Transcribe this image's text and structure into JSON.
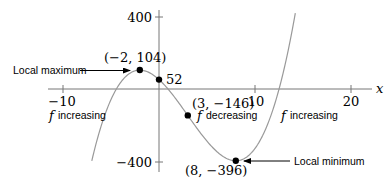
{
  "chart_data": {
    "type": "line",
    "title": "",
    "function": "f(x) = x^3 - 9x^2 - 48x + 52",
    "xlabel": "x",
    "ylabel": "",
    "xlim": [
      -10,
      20
    ],
    "ylim": [
      -400,
      400
    ],
    "x_ticks": [
      -10,
      10,
      20
    ],
    "x_tick_labels": [
      "−10",
      "10",
      "20"
    ],
    "y_ticks": [
      400,
      -400
    ],
    "y_tick_labels": [
      "400",
      "−400"
    ],
    "grid": false,
    "series": [
      {
        "name": "f",
        "domain": [
          -7,
          14.2
        ],
        "color": "#999999"
      }
    ],
    "points": [
      {
        "x": -2,
        "y": 104,
        "label": "(−2, 104)"
      },
      {
        "x": 0,
        "y": 52,
        "label": "52"
      },
      {
        "x": 3,
        "y": -146,
        "label": "(3, −146)"
      },
      {
        "x": 8,
        "y": -396,
        "label": "(8, −396)"
      }
    ],
    "annotations": [
      {
        "text": "Local maximum",
        "target": [
          -2,
          104
        ]
      },
      {
        "text": "Local minimum",
        "target": [
          8,
          -396
        ]
      },
      {
        "text": "f increasing",
        "region": "left"
      },
      {
        "text": "f decreasing",
        "region": "middle"
      },
      {
        "text": "f increasing",
        "region": "right"
      }
    ]
  },
  "labels": {
    "x_axis": "x",
    "ytick_400": "400",
    "ytick_neg400": "−400",
    "xtick_neg10": "−10",
    "xtick_10": "10",
    "xtick_20": "20",
    "pt_max": "(−2, 104)",
    "pt_intercept": "52",
    "pt_inflection": "(3, −146)",
    "pt_min": "(8, −396)",
    "local_max": "Local maximum",
    "local_min": "Local minimum",
    "f_symbol": "f",
    "increasing": "increasing",
    "decreasing": "decreasing"
  }
}
